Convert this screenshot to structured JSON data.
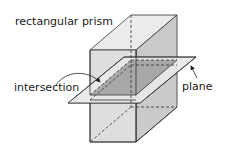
{
  "labels": {
    "prism": "rectangular prism",
    "intersection": "intersection",
    "plane": "plane"
  },
  "colors": {
    "front_face": "#dcdcdc",
    "top_face": "#ebebeb",
    "side_face": "#c9c9c9",
    "plane": "#e6e6e6",
    "intersection": "#a9a9a9",
    "stroke": "#333333"
  }
}
